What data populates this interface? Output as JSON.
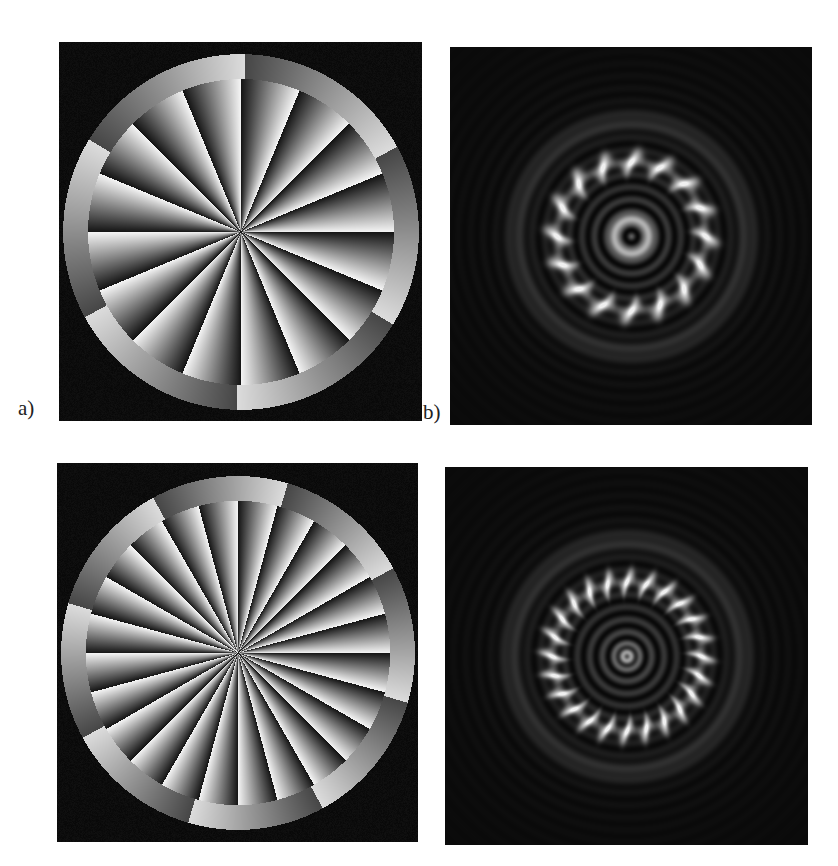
{
  "figure": {
    "panels": [
      {
        "id": "a",
        "label": "a)",
        "kind": "phase-mask",
        "sectors": 16,
        "outer_ring_sectors": 6,
        "left": 59,
        "top": 42,
        "width": 363,
        "height": 379
      },
      {
        "id": "b",
        "label": "b)",
        "kind": "intensity-pattern",
        "petals": 16,
        "left": 450,
        "top": 47,
        "width": 362,
        "height": 378
      },
      {
        "id": "c",
        "label": "",
        "kind": "phase-mask",
        "sectors": 24,
        "outer_ring_sectors": 8,
        "left": 57,
        "top": 463,
        "width": 361,
        "height": 379
      },
      {
        "id": "d",
        "label": "",
        "kind": "intensity-pattern",
        "petals": 24,
        "left": 445,
        "top": 467,
        "width": 363,
        "height": 378
      }
    ],
    "labels": {
      "a": {
        "text": "a)",
        "left": 18,
        "top": 398
      },
      "b": {
        "text": "b)",
        "left": 423,
        "top": 402
      }
    }
  }
}
